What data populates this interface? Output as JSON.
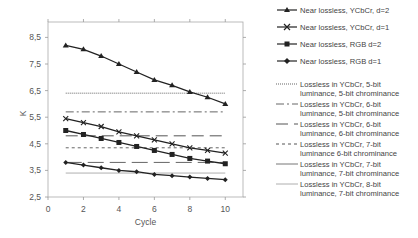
{
  "chart_data": {
    "type": "line",
    "title": "",
    "xlabel": "Cycle",
    "ylabel": "K",
    "xlim": [
      0,
      11
    ],
    "ylim": [
      2.5,
      9.0
    ],
    "xticks": [
      0,
      2,
      4,
      6,
      8,
      10
    ],
    "xtick_labels": [
      "0",
      "2",
      "4",
      "6",
      "8",
      "10"
    ],
    "yticks": [
      2.5,
      3.5,
      4.5,
      5.5,
      6.5,
      7.5,
      8.5
    ],
    "ytick_labels": [
      "2,5",
      "3,5",
      "4,5",
      "5,5",
      "6,5",
      "7,5",
      "8,5"
    ],
    "grid": false,
    "legend_position": "right",
    "x": [
      1,
      2,
      3,
      4,
      5,
      6,
      7,
      8,
      9,
      10
    ],
    "series": [
      {
        "name": "Near lossless, YCbCr, d=2",
        "marker": "triangle",
        "values": [
          8.2,
          8.05,
          7.8,
          7.5,
          7.2,
          6.9,
          6.7,
          6.45,
          6.25,
          6.0
        ]
      },
      {
        "name": "Near lossless, YCbCr, d=1",
        "marker": "x",
        "values": [
          5.45,
          5.3,
          5.15,
          4.95,
          4.8,
          4.65,
          4.5,
          4.35,
          4.25,
          4.15
        ]
      },
      {
        "name": "Near lossless, RGB d=2",
        "marker": "square",
        "values": [
          5.0,
          4.85,
          4.7,
          4.55,
          4.4,
          4.25,
          4.1,
          3.95,
          3.85,
          3.75
        ]
      },
      {
        "name": "Near lossless, RGB d=1",
        "marker": "diamond",
        "values": [
          3.8,
          3.7,
          3.6,
          3.5,
          3.45,
          3.35,
          3.3,
          3.25,
          3.2,
          3.15
        ]
      },
      {
        "name": "Lossless in YCbCr, 5-bit luminance, 5-bit chrominance",
        "style": "dotted-gray",
        "constant": 6.4
      },
      {
        "name": "Lossless in YCbCr, 6-bit luminance, 5-bit chrominance",
        "style": "dash-dot",
        "constant": 5.7
      },
      {
        "name": "Lossless in YCbCr, 6-bit luminance, 6-bit chrominance",
        "style": "long-dash",
        "constant": 4.8
      },
      {
        "name": "Lossless in YCbCr, 7-bit luminance 6-bit chrominance",
        "style": "short-dash",
        "constant": 4.35
      },
      {
        "name": "Lossless in YCbCr, 7-bit luminance, 7-bit chrominance",
        "style": "long-dash-gray",
        "constant": 3.8
      },
      {
        "name": "Lossless in YCbCr, 8-bit luminance, 7-bit chrominance",
        "style": "solid-thin",
        "constant": 3.4
      }
    ]
  },
  "legend": [
    {
      "line1": "Near lossless, YCbCr, d=2",
      "line2": ""
    },
    {
      "line1": "Near lossless, YCbCr, d=1",
      "line2": ""
    },
    {
      "line1": "Near lossless, RGB d=2",
      "line2": ""
    },
    {
      "line1": "Near lossless, RGB d=1",
      "line2": ""
    },
    {
      "line1": "Lossless in YCbCr, 5-bit",
      "line2": "luminance, 5-bit chrominance"
    },
    {
      "line1": "Lossless in YCbCr, 6-bit",
      "line2": "luminance, 5-bit chrominance"
    },
    {
      "line1": "Lossless in YCbCr, 6-bit",
      "line2": "luminance, 6-bit chrominance"
    },
    {
      "line1": "Lossless in YCbCr, 7-bit",
      "line2": "luminance 6-bit chrominance"
    },
    {
      "line1": "Lossless in YCbCr, 7-bit",
      "line2": "luminance, 7-bit chrominance"
    },
    {
      "line1": "Lossless in YCbCr, 8-bit",
      "line2": "luminance, 7-bit chrominance"
    }
  ],
  "colors": {
    "series_line": "#222222",
    "axis": "#999999",
    "text": "#444444",
    "hline_gray": "#aaaaaa"
  }
}
